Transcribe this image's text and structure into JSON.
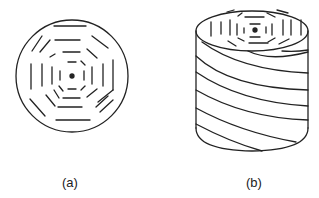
{
  "figure": {
    "panels": [
      {
        "id": "a",
        "label": "(a)",
        "description": "Circular cross-section with concentric octagonal dashed rings and a central dot"
      },
      {
        "id": "b",
        "label": "(b)",
        "description": "Cylinder whose top face shows concentric octagonal dashed rings; side wrapped with helical lines"
      }
    ],
    "colors": {
      "stroke": "#222222",
      "background": "#ffffff"
    }
  }
}
